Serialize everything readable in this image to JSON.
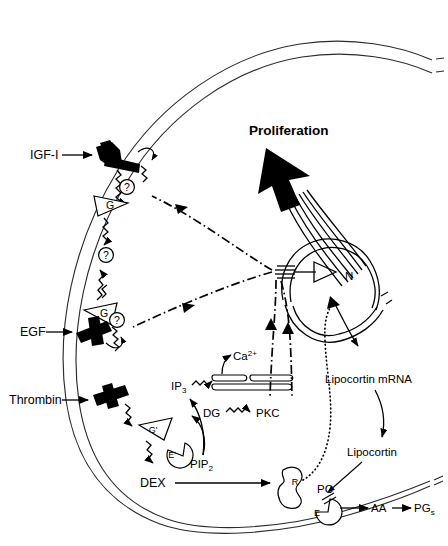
{
  "figure": {
    "background_color": "#ffffff",
    "ink_color": "#000000"
  },
  "labels": {
    "igf1": "IGF-I",
    "egf": "EGF",
    "thrombin": "Thrombin",
    "dex": "DEX",
    "proliferation": "Proliferation",
    "nucleus": "N",
    "calcium": "Ca",
    "calcium_sup": "2+",
    "ip3": "IP",
    "ip3_sub": "3",
    "dg": "DG",
    "pkc": "PKC",
    "pip2": "PIP",
    "pip2_sub": "2",
    "lipocortin_mrna": "Lipocortin mRNA",
    "lipocortin": "Lipocortin",
    "pc": "PC",
    "aa": "AA",
    "pg": "PG",
    "pg_sub": "s",
    "receptor_r": "R",
    "enzyme_e": "E",
    "enzyme_e_prime": "E'",
    "g_protein": "G",
    "g_protein_prime": "G'",
    "unknown": "?"
  },
  "elements": {
    "membrane_name": "plasma-membrane",
    "nucleus_name": "nucleus",
    "er_name": "endoplasmic-reticulum-calcium-store",
    "receptors": [
      {
        "name": "igf1-receptor",
        "ligand": "IGF-I"
      },
      {
        "name": "egf-receptor",
        "ligand": "EGF"
      },
      {
        "name": "thrombin-receptor",
        "ligand": "Thrombin"
      }
    ]
  },
  "colors": {
    "ink": "#000000",
    "membrane": "#2b2b2b",
    "paper": "#ffffff"
  }
}
